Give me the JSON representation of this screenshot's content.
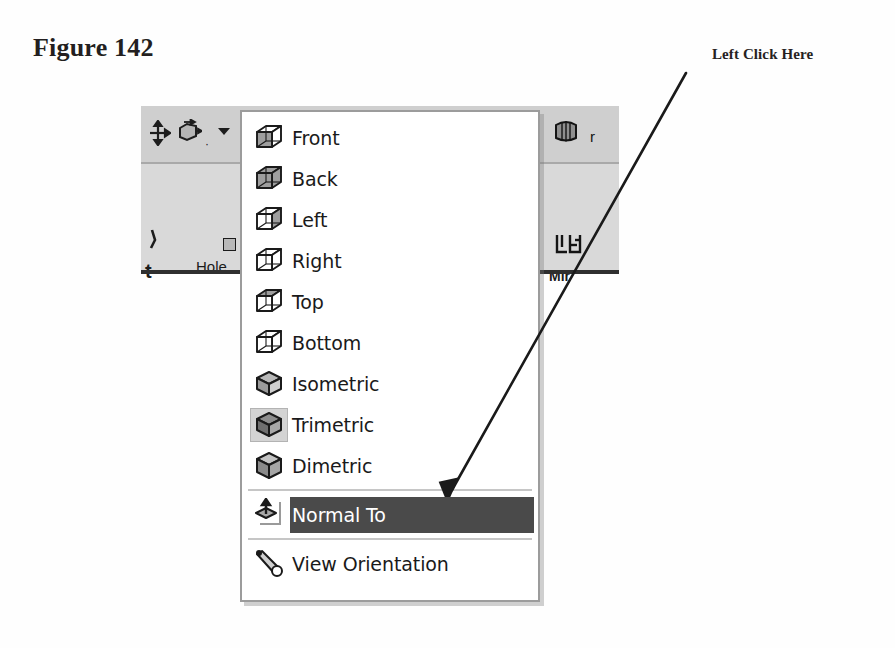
{
  "figure": {
    "caption": "Figure 142"
  },
  "callout": {
    "label": "Left Click Here",
    "arrow_icon": "arrow-pointer-icon",
    "points_to": "Normal To"
  },
  "colors": {
    "page_background": "#ffffff",
    "toolbar_background": "#d5d5d5",
    "menu_background": "#ffffff",
    "menu_border": "#9c9c9c",
    "highlight_background": "#4a4a4a",
    "highlight_text": "#ffffff",
    "separator": "#c6c6c6",
    "text": "#1a1a1a"
  },
  "toolbar": {
    "top_row": {
      "move_icon": "move-four-arrows-icon",
      "rotate_view_icon": "rotate-view-icon",
      "dropdown_caret_icon": "chevron-down-icon",
      "rib_icon": "rib-icon",
      "rib_label_fragment": "r"
    },
    "bottom_row": {
      "left_fragment_icon": "partial-tool-icon",
      "left_fragment_label": "t",
      "hole_label": "Hole",
      "hole_badge_icon": "hole-wizard-badge-icon",
      "mirror_icon": "mirror-icon",
      "mirror_label": "Mir"
    }
  },
  "menu": {
    "name": "view-orientation-menu",
    "items": [
      {
        "label": "Front",
        "icon": "cube-front-icon",
        "type": "item",
        "selected": false,
        "pressed": false
      },
      {
        "label": "Back",
        "icon": "cube-back-icon",
        "type": "item",
        "selected": false,
        "pressed": false
      },
      {
        "label": "Left",
        "icon": "cube-left-icon",
        "type": "item",
        "selected": false,
        "pressed": false
      },
      {
        "label": "Right",
        "icon": "cube-right-icon",
        "type": "item",
        "selected": false,
        "pressed": false
      },
      {
        "label": "Top",
        "icon": "cube-top-icon",
        "type": "item",
        "selected": false,
        "pressed": false
      },
      {
        "label": "Bottom",
        "icon": "cube-bottom-icon",
        "type": "item",
        "selected": false,
        "pressed": false
      },
      {
        "label": "Isometric",
        "icon": "cube-isometric-icon",
        "type": "item",
        "selected": false,
        "pressed": false
      },
      {
        "label": "Trimetric",
        "icon": "cube-trimetric-icon",
        "type": "item",
        "selected": false,
        "pressed": true
      },
      {
        "label": "Dimetric",
        "icon": "cube-dimetric-icon",
        "type": "item",
        "selected": false,
        "pressed": false
      },
      {
        "label": "",
        "icon": "",
        "type": "separator",
        "selected": false,
        "pressed": false
      },
      {
        "label": "Normal To",
        "icon": "normal-to-icon",
        "type": "item",
        "selected": true,
        "pressed": false
      },
      {
        "label": "",
        "icon": "",
        "type": "separator",
        "selected": false,
        "pressed": false
      },
      {
        "label": "View Orientation",
        "icon": "telescope-icon",
        "type": "item",
        "selected": false,
        "pressed": false
      }
    ]
  }
}
